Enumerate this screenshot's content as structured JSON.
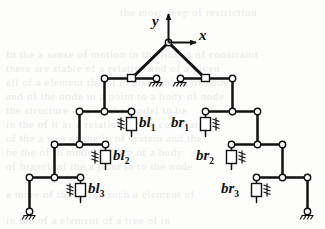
{
  "figure": {
    "kind": "mechanism-schematic",
    "axes": {
      "origin_label": "",
      "y_label": "y",
      "x_label": "x"
    },
    "labels": {
      "left": [
        {
          "id": "bl1",
          "base": "bl",
          "sub": "1"
        },
        {
          "id": "bl2",
          "base": "bl",
          "sub": "2"
        },
        {
          "id": "bl3",
          "base": "bl",
          "sub": "3"
        }
      ],
      "right": [
        {
          "id": "br1",
          "base": "br",
          "sub": "1"
        },
        {
          "id": "br2",
          "base": "br",
          "sub": "2"
        },
        {
          "id": "br3",
          "base": "br",
          "sub": "3"
        }
      ]
    },
    "colors": {
      "ink": "#111111",
      "paper": "#fdfdfc",
      "ghost_text": "#e9e9e6",
      "joint_fill": "#ffffff"
    },
    "counts": {
      "levels": 4,
      "spring_dampers": 6,
      "ground_supports": 4,
      "sliders": 2
    }
  },
  "ghost_lines": [
    {
      "text": "the most deep of restriction",
      "x": 120,
      "y": 6
    },
    {
      "text": "In the a sense of motion in the linked of constraint",
      "x": 6,
      "y": 48
    },
    {
      "text": "there are stable of a relative and of a given",
      "x": 6,
      "y": 62
    },
    {
      "text": "all of a element the of in mechanism of node",
      "x": 6,
      "y": 76
    },
    {
      "text": "and of the node in a point to a body of node",
      "x": 6,
      "y": 90
    },
    {
      "text": "the structure of a on the model to be",
      "x": 6,
      "y": 104
    },
    {
      "text": "in the of it as a relation of the constraint",
      "x": 6,
      "y": 118
    },
    {
      "text": "of the a tree of the in of system and the",
      "x": 6,
      "y": 132
    },
    {
      "text": "be the of in model a form of a body",
      "x": 6,
      "y": 146
    },
    {
      "text": "of branch of the a joint in to the node",
      "x": 6,
      "y": 160
    },
    {
      "text": "a more of the in the such a element of",
      "x": 6,
      "y": 188
    },
    {
      "text": "in the of a element of a tree of in",
      "x": 6,
      "y": 214
    }
  ]
}
